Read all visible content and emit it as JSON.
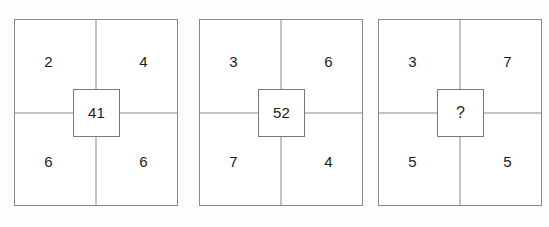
{
  "figure": {
    "type": "logic-puzzle-grid",
    "panel_count": 3,
    "background_color": "#fdfdfd",
    "line_color": "#8a8a8a",
    "text_color": "#1c1c1c"
  },
  "panels": [
    {
      "id": "panel-1",
      "top_left": "2",
      "top_right": "4",
      "bottom_left": "6",
      "bottom_right": "6",
      "center": "41"
    },
    {
      "id": "panel-2",
      "top_left": "3",
      "top_right": "6",
      "bottom_left": "7",
      "bottom_right": "4",
      "center": "52"
    },
    {
      "id": "panel-3",
      "top_left": "3",
      "top_right": "7",
      "bottom_left": "5",
      "bottom_right": "5",
      "center": "?"
    }
  ]
}
